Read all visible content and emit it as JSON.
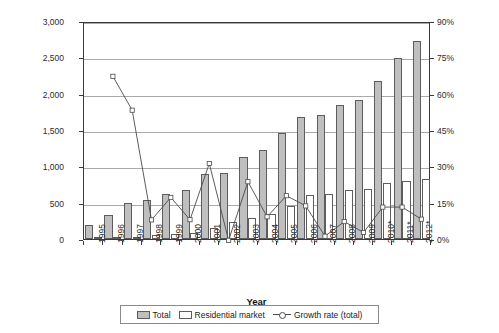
{
  "chart_data": {
    "type": "bar",
    "title": "",
    "xlabel": "Year",
    "ylabel": "Pellet consumption [1,000 t (w.b.)p/a]",
    "ylabel_line1": "Pellet consumption",
    "ylabel_line2_pre": "[1,000 t (w.b.)",
    "ylabel_line2_sub": "p",
    "ylabel_line2_post": "/a]",
    "y2label": "Growth rate [%]",
    "ylim": [
      0,
      3000
    ],
    "y2lim": [
      0,
      90
    ],
    "grid": true,
    "legend_position": "bottom",
    "categories": [
      "1995",
      "1996",
      "1997",
      "1998",
      "1999",
      "2000",
      "2001",
      "2002",
      "2003",
      "2004",
      "2005",
      "2006",
      "2007",
      "2008",
      "2009",
      "2010*",
      "2011*",
      "2012*"
    ],
    "yticks": [
      "0",
      "500",
      "1,000",
      "1,500",
      "2,000",
      "2,500",
      "3,000"
    ],
    "ytick_values": [
      0,
      500,
      1000,
      1500,
      2000,
      2500,
      3000
    ],
    "y2ticks": [
      "0%",
      "15%",
      "30%",
      "45%",
      "60%",
      "75%",
      "90%"
    ],
    "y2tick_values": [
      0,
      15,
      30,
      45,
      60,
      75,
      90
    ],
    "series": [
      {
        "name": "Total",
        "kind": "bar",
        "color": "#bfbfbf",
        "axis": "left",
        "values": [
          190,
          325,
          500,
          540,
          620,
          680,
          900,
          910,
          1125,
          1230,
          1460,
          1675,
          1710,
          1850,
          1910,
          2180,
          2490,
          2720
        ]
      },
      {
        "name": "Residential market",
        "kind": "bar",
        "color": "#ffffff",
        "axis": "left",
        "values": [
          10,
          25,
          30,
          50,
          75,
          80,
          150,
          235,
          295,
          340,
          450,
          600,
          625,
          675,
          695,
          765,
          795,
          825
        ]
      },
      {
        "name": "Growth rate (total)",
        "kind": "line",
        "color": "#4a4a4a",
        "axis": "right",
        "values": [
          null,
          68.0,
          54.0,
          8.7,
          18.0,
          8.8,
          32.0,
          0.3,
          24.5,
          10.0,
          18.7,
          14.5,
          2.0,
          8.0,
          3.5,
          14.0,
          14.0,
          9.0
        ]
      }
    ],
    "legend": [
      {
        "label": "Total",
        "marker": "swatch-gray"
      },
      {
        "label": "Residential market",
        "marker": "swatch-white"
      },
      {
        "label": "Growth rate (total)",
        "marker": "line-circle"
      }
    ],
    "footnote": ""
  }
}
